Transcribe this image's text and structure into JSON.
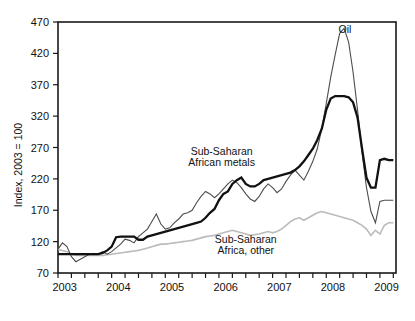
{
  "chart_data": {
    "type": "line",
    "title": "",
    "xlabel": "",
    "ylabel": "Index, 2003 = 100",
    "xlim": [
      2003.0,
      2009.3
    ],
    "ylim": [
      70,
      470
    ],
    "yticks": [
      70,
      120,
      170,
      220,
      270,
      320,
      370,
      420,
      470
    ],
    "xticks_major": [
      2003,
      2004,
      2005,
      2006,
      2007,
      2008,
      2009
    ],
    "xticks_minor_step": 0.25,
    "grid": false,
    "legend": "inline-annotations",
    "annotations": [
      {
        "text": "Oil",
        "x": 2008.35,
        "y": 452
      },
      {
        "text": "Sub-Saharan",
        "x": 2006.05,
        "y": 258
      },
      {
        "text": "African metals",
        "x": 2006.05,
        "y": 240
      },
      {
        "text": "Sub-Saharan",
        "x": 2006.5,
        "y": 118
      },
      {
        "text": "Africa, other",
        "x": 2006.5,
        "y": 101
      }
    ],
    "series": [
      {
        "name": "Sub-Saharan African metals",
        "color": "#111111",
        "width": 2.3,
        "x": [
          2003.0,
          2003.083,
          2003.167,
          2003.25,
          2003.333,
          2003.417,
          2003.5,
          2003.583,
          2003.667,
          2003.75,
          2003.833,
          2003.917,
          2004.0,
          2004.083,
          2004.167,
          2004.25,
          2004.333,
          2004.417,
          2004.5,
          2004.583,
          2004.667,
          2004.75,
          2004.833,
          2004.917,
          2005.0,
          2005.083,
          2005.167,
          2005.25,
          2005.333,
          2005.417,
          2005.5,
          2005.583,
          2005.667,
          2005.75,
          2005.833,
          2005.917,
          2006.0,
          2006.083,
          2006.167,
          2006.25,
          2006.333,
          2006.417,
          2006.5,
          2006.583,
          2006.667,
          2006.75,
          2006.833,
          2006.917,
          2007.0,
          2007.083,
          2007.167,
          2007.25,
          2007.333,
          2007.417,
          2007.5,
          2007.583,
          2007.667,
          2007.75,
          2007.833,
          2007.917,
          2008.0,
          2008.083,
          2008.167,
          2008.25,
          2008.333,
          2008.417,
          2008.5,
          2008.583,
          2008.667,
          2008.75,
          2008.833,
          2008.917,
          2009.0,
          2009.083,
          2009.167,
          2009.25
        ],
        "values": [
          100,
          100,
          100,
          100,
          100,
          100,
          100,
          100,
          100,
          100,
          102,
          106,
          112,
          127,
          128,
          128,
          128,
          128,
          123,
          123,
          128,
          130,
          132,
          134,
          136,
          138,
          140,
          142,
          144,
          146,
          148,
          150,
          152,
          158,
          166,
          172,
          186,
          196,
          200,
          212,
          218,
          222,
          212,
          208,
          208,
          212,
          218,
          220,
          222,
          224,
          226,
          228,
          230,
          234,
          240,
          248,
          258,
          268,
          282,
          300,
          330,
          348,
          352,
          352,
          352,
          350,
          342,
          318,
          268,
          222,
          206,
          206,
          250,
          252,
          250,
          250
        ]
      },
      {
        "name": "Oil",
        "color": "#4d4d4d",
        "width": 1.1,
        "x": [
          2003.0,
          2003.083,
          2003.167,
          2003.25,
          2003.333,
          2003.417,
          2003.5,
          2003.583,
          2003.667,
          2003.75,
          2003.833,
          2003.917,
          2004.0,
          2004.083,
          2004.167,
          2004.25,
          2004.333,
          2004.417,
          2004.5,
          2004.583,
          2004.667,
          2004.75,
          2004.833,
          2004.917,
          2005.0,
          2005.083,
          2005.167,
          2005.25,
          2005.333,
          2005.417,
          2005.5,
          2005.583,
          2005.667,
          2005.75,
          2005.833,
          2005.917,
          2006.0,
          2006.083,
          2006.167,
          2006.25,
          2006.333,
          2006.417,
          2006.5,
          2006.583,
          2006.667,
          2006.75,
          2006.833,
          2006.917,
          2007.0,
          2007.083,
          2007.167,
          2007.25,
          2007.333,
          2007.417,
          2007.5,
          2007.583,
          2007.667,
          2007.75,
          2007.833,
          2007.917,
          2008.0,
          2008.083,
          2008.167,
          2008.25,
          2008.333,
          2008.417,
          2008.5,
          2008.583,
          2008.667,
          2008.75,
          2008.833,
          2008.917,
          2009.0,
          2009.083,
          2009.167,
          2009.25
        ],
        "values": [
          108,
          118,
          112,
          96,
          88,
          92,
          96,
          100,
          100,
          100,
          104,
          100,
          104,
          110,
          116,
          124,
          122,
          118,
          128,
          134,
          140,
          152,
          164,
          148,
          140,
          142,
          150,
          156,
          164,
          166,
          170,
          182,
          192,
          200,
          196,
          190,
          196,
          204,
          212,
          218,
          214,
          206,
          196,
          188,
          184,
          192,
          204,
          212,
          206,
          198,
          204,
          216,
          226,
          234,
          226,
          218,
          232,
          248,
          268,
          300,
          340,
          382,
          418,
          452,
          460,
          438,
          390,
          330,
          262,
          206,
          168,
          150,
          184,
          186,
          186,
          186
        ]
      },
      {
        "name": "Sub-Saharan Africa, other",
        "color": "#bbbbbb",
        "width": 1.6,
        "x": [
          2003.0,
          2003.083,
          2003.167,
          2003.25,
          2003.333,
          2003.417,
          2003.5,
          2003.583,
          2003.667,
          2003.75,
          2003.833,
          2003.917,
          2004.0,
          2004.083,
          2004.167,
          2004.25,
          2004.333,
          2004.417,
          2004.5,
          2004.583,
          2004.667,
          2004.75,
          2004.833,
          2004.917,
          2005.0,
          2005.083,
          2005.167,
          2005.25,
          2005.333,
          2005.417,
          2005.5,
          2005.583,
          2005.667,
          2005.75,
          2005.833,
          2005.917,
          2006.0,
          2006.083,
          2006.167,
          2006.25,
          2006.333,
          2006.417,
          2006.5,
          2006.583,
          2006.667,
          2006.75,
          2006.833,
          2006.917,
          2007.0,
          2007.083,
          2007.167,
          2007.25,
          2007.333,
          2007.417,
          2007.5,
          2007.583,
          2007.667,
          2007.75,
          2007.833,
          2007.917,
          2008.0,
          2008.083,
          2008.167,
          2008.25,
          2008.333,
          2008.417,
          2008.5,
          2008.583,
          2008.667,
          2008.75,
          2008.833,
          2008.917,
          2009.0,
          2009.083,
          2009.167,
          2009.25
        ],
        "values": [
          108,
          106,
          104,
          100,
          98,
          98,
          98,
          98,
          98,
          98,
          98,
          99,
          100,
          101,
          102,
          103,
          104,
          105,
          106,
          108,
          110,
          112,
          114,
          116,
          116,
          117,
          118,
          119,
          120,
          121,
          122,
          124,
          126,
          128,
          129,
          130,
          132,
          134,
          136,
          138,
          136,
          134,
          132,
          130,
          131,
          132,
          134,
          136,
          134,
          136,
          140,
          146,
          152,
          156,
          158,
          154,
          158,
          162,
          166,
          168,
          166,
          164,
          162,
          160,
          158,
          156,
          154,
          150,
          146,
          140,
          130,
          138,
          132,
          146,
          150,
          150
        ]
      }
    ]
  }
}
